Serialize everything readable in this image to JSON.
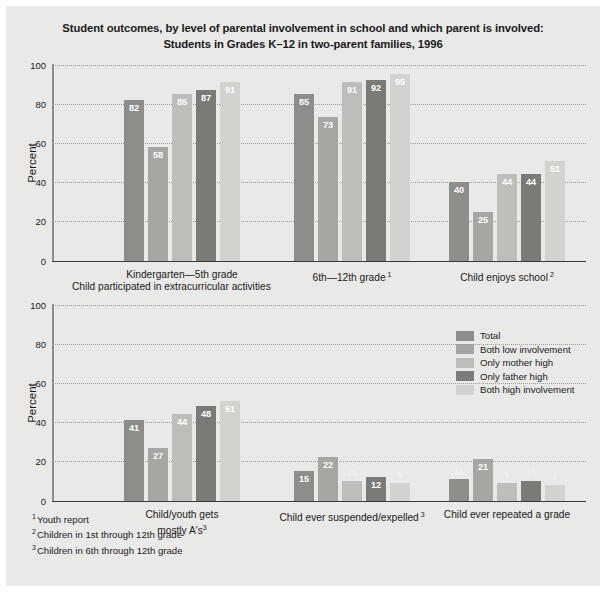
{
  "title": {
    "line1": "Student outcomes, by level of parental involvement in school and which parent is involved:",
    "line2": "Students in Grades K–12 in two-parent families, 1996"
  },
  "legend": {
    "items": [
      {
        "label": "Total",
        "color": "#8d8d8a"
      },
      {
        "label": "Both low involvement",
        "color": "#a6a6a2"
      },
      {
        "label": "Only mother high",
        "color": "#bdbdb9"
      },
      {
        "label": "Only father high",
        "color": "#7a7a77"
      },
      {
        "label": "Both high involvement",
        "color": "#d2d2ce"
      }
    ]
  },
  "axis": {
    "ylabel": "Percent",
    "yticks": [
      0,
      20,
      40,
      60,
      80,
      100
    ],
    "ymin": 0,
    "ymax": 100
  },
  "chart_data": [
    {
      "type": "bar",
      "title": "",
      "xlabel": "",
      "ylabel": "Percent",
      "ylim": [
        0,
        100
      ],
      "grid": true,
      "legend_position": "none",
      "categories": [
        "Kindergarten—5th grade",
        "6th—12th grade",
        "Child enjoys school"
      ],
      "category_footnotes": [
        "",
        "1",
        "2"
      ],
      "caption": "Child participated in extracurricular activities",
      "series": [
        {
          "name": "Total",
          "values": [
            82,
            85,
            40
          ]
        },
        {
          "name": "Both low involvement",
          "values": [
            58,
            73,
            25
          ]
        },
        {
          "name": "Only mother high",
          "values": [
            85,
            91,
            44
          ]
        },
        {
          "name": "Only father high",
          "values": [
            87,
            92,
            44
          ]
        },
        {
          "name": "Both high involvement",
          "values": [
            91,
            95,
            51
          ]
        }
      ]
    },
    {
      "type": "bar",
      "title": "",
      "xlabel": "",
      "ylabel": "Percent",
      "ylim": [
        0,
        100
      ],
      "grid": true,
      "legend_position": "top-right",
      "categories": [
        "Child/youth gets mostly A's",
        "Child ever suspended/expelled",
        "Child ever repeated a grade"
      ],
      "category_footnotes": [
        "3",
        "3",
        ""
      ],
      "caption": "",
      "series": [
        {
          "name": "Total",
          "values": [
            41,
            15,
            11
          ]
        },
        {
          "name": "Both low involvement",
          "values": [
            27,
            22,
            21
          ]
        },
        {
          "name": "Only mother high",
          "values": [
            44,
            10,
            9
          ]
        },
        {
          "name": "Only father high",
          "values": [
            48,
            12,
            10
          ]
        },
        {
          "name": "Both high involvement",
          "values": [
            51,
            9,
            8
          ]
        }
      ]
    }
  ],
  "footnotes": [
    {
      "mark": "1",
      "text": "Youth report"
    },
    {
      "mark": "2",
      "text": "Children in 1st through 12th grade"
    },
    {
      "mark": "3",
      "text": "Children in 6th through 12th grade"
    }
  ]
}
